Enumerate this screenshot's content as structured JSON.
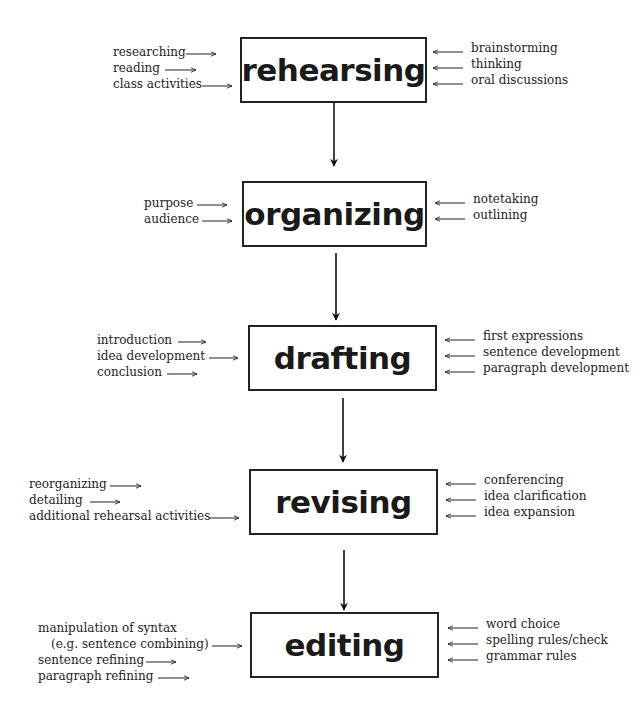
{
  "diagram": {
    "type": "writing-process-flow",
    "stages": [
      {
        "name": "rehearsing",
        "left_inputs": [
          "researching",
          "reading",
          "class activities"
        ],
        "right_inputs": [
          "brainstorming",
          "thinking",
          "oral discussions"
        ]
      },
      {
        "name": "organizing",
        "left_inputs": [
          "purpose",
          "audience"
        ],
        "right_inputs": [
          "notetaking",
          "outlining"
        ]
      },
      {
        "name": "drafting",
        "left_inputs": [
          "introduction",
          "idea development",
          "conclusion"
        ],
        "right_inputs": [
          "first expressions",
          "sentence development",
          "paragraph development"
        ]
      },
      {
        "name": "revising",
        "left_inputs": [
          "reorganizing",
          "detailing",
          "additional rehearsal activities"
        ],
        "right_inputs": [
          "conferencing",
          "idea clarification",
          "idea expansion"
        ]
      },
      {
        "name": "editing",
        "left_inputs": [
          "manipulation of syntax",
          "(e.g. sentence combining)",
          "sentence refining",
          "paragraph refining"
        ],
        "right_inputs": [
          "word choice",
          "spelling rules/check",
          "grammar rules"
        ]
      }
    ]
  }
}
